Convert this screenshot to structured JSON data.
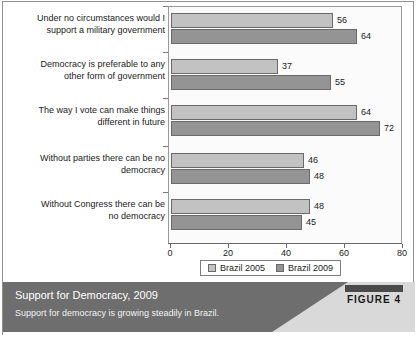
{
  "chart_data": {
    "type": "bar",
    "orientation": "horizontal",
    "title": "Support for Democracy, 2009",
    "subtitle": "Support for democracy is growing steadily in Brazil.",
    "xlabel": "",
    "ylabel": "",
    "xlim": [
      0,
      80
    ],
    "xticks": [
      0,
      20,
      40,
      60,
      80
    ],
    "xtick_labels": [
      "0",
      "20",
      "40",
      "60",
      "80"
    ],
    "grid": false,
    "legend_position": "bottom",
    "categories": [
      "Under no circumstances would I support a military government",
      "Democracy is preferable to any other form of government",
      "The way I vote can make things different in future",
      "Without parties there can be no democracy",
      "Without Congress there can be no democracy"
    ],
    "category_lines": [
      [
        "Under no circumstances would I",
        "support a military government"
      ],
      [
        "Democracy is preferable to any",
        "other form of government"
      ],
      [
        "The way I vote can make things",
        "different in future"
      ],
      [
        "Without parties there can be no",
        "democracy"
      ],
      [
        "Without Congress there can be",
        "no democracy"
      ]
    ],
    "series": [
      {
        "name": "Brazil 2005",
        "color": "#c2c2c2",
        "values": [
          56,
          37,
          64,
          46,
          48
        ]
      },
      {
        "name": "Brazil 2009",
        "color": "#949494",
        "values": [
          64,
          55,
          72,
          48,
          45
        ]
      }
    ]
  },
  "legend": {
    "items": [
      {
        "label": "Brazil 2005",
        "swatch": "light-gray"
      },
      {
        "label": "Brazil 2009",
        "swatch": "dark-gray"
      }
    ]
  },
  "caption": {
    "title": "Support for Democracy, 2009",
    "subtitle": "Support for democracy is growing steadily in Brazil."
  },
  "badge": {
    "label": "FIGURE 4"
  },
  "colors": {
    "series_2005": "#c2c2c2",
    "series_2009": "#949494",
    "caption_band": "#6e6e6e",
    "frame": "#8f8f8f"
  }
}
